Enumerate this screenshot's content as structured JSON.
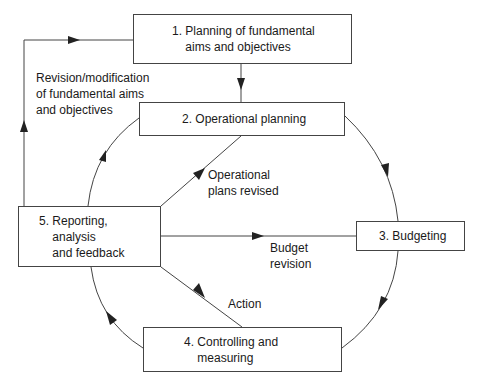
{
  "diagram": {
    "type": "cycle-flow",
    "nodes": [
      {
        "id": "n1",
        "label": "1. Planning of fundamental\n    aims and objectives"
      },
      {
        "id": "n2",
        "label": "2. Operational planning"
      },
      {
        "id": "n3",
        "label": "3. Budgeting"
      },
      {
        "id": "n4",
        "label": "4. Controlling and\n    measuring"
      },
      {
        "id": "n5",
        "label": "5. Reporting,\n    analysis\n    and feedback"
      }
    ],
    "edges": [
      {
        "from": "n1",
        "to": "n2",
        "label": ""
      },
      {
        "from": "n2",
        "to": "n3",
        "label": ""
      },
      {
        "from": "n3",
        "to": "n4",
        "label": ""
      },
      {
        "from": "n4",
        "to": "n5",
        "label": ""
      },
      {
        "from": "n5",
        "to": "n2",
        "label": ""
      },
      {
        "from": "n5",
        "to": "n1",
        "label": "Revision/modification\nof fundamental aims\nand objectives"
      },
      {
        "from": "n5",
        "to": "n2",
        "label": "Operational\nplans revised"
      },
      {
        "from": "n5",
        "to": "n3",
        "label": "Budget\nrevision"
      },
      {
        "from": "n5",
        "to": "n4",
        "label": "Action"
      }
    ]
  },
  "labels": {
    "revision": "Revision/modification\nof fundamental aims\nand objectives",
    "operational_revised": "Operational\nplans revised",
    "budget_revision": "Budget\nrevision",
    "action": "Action"
  },
  "colors": {
    "line": "#444444",
    "text": "#1a1a1a",
    "background": "#ffffff"
  }
}
